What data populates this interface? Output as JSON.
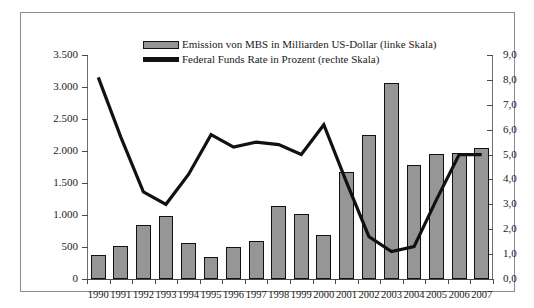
{
  "chart_data": {
    "type": "bar",
    "title": "",
    "subtitle": "",
    "xlabel": "",
    "ylabel": "",
    "grid": false,
    "legend_position": "top-center",
    "categories": [
      "1990",
      "1991",
      "1992",
      "1993",
      "1994",
      "1995",
      "1996",
      "1997",
      "1998",
      "1999",
      "2000",
      "2001",
      "2002",
      "2003",
      "2004",
      "2005",
      "2006",
      "2007"
    ],
    "left_axis": {
      "label": "Emission von MBS in Milliarden US-Dollar",
      "ticks": [
        "0",
        "500",
        "1.000",
        "1.500",
        "2.000",
        "2.500",
        "3.000",
        "3.500"
      ],
      "tick_values": [
        0,
        500,
        1000,
        1500,
        2000,
        2500,
        3000,
        3500
      ],
      "ylim": [
        0,
        3500
      ]
    },
    "right_axis": {
      "label": "Federal Funds Rate in Prozent",
      "ticks": [
        "0,0",
        "1,0",
        "2,0",
        "3,0",
        "4,0",
        "5,0",
        "6,0",
        "7,0",
        "8,0",
        "9,0"
      ],
      "tick_values": [
        0,
        1,
        2,
        3,
        4,
        5,
        6,
        7,
        8,
        9
      ],
      "ylim": [
        0,
        9
      ]
    },
    "series": [
      {
        "name": "Emission von MBS in Milliarden US-Dollar (linke Skala)",
        "type": "bar",
        "axis": "left",
        "color": "#969696",
        "values": [
          380,
          510,
          845,
          990,
          570,
          350,
          495,
          600,
          1140,
          1020,
          680,
          1670,
          2245,
          3060,
          1775,
          1950,
          1975,
          2040
        ]
      },
      {
        "name": "Federal Funds Rate in Prozent (rechte Skala)",
        "type": "line",
        "axis": "right",
        "color": "#111111",
        "values": [
          8.1,
          5.7,
          3.5,
          3.0,
          4.2,
          5.8,
          5.3,
          5.5,
          5.4,
          5.0,
          6.2,
          3.9,
          1.7,
          1.1,
          1.3,
          3.2,
          5.0,
          5.0
        ]
      }
    ]
  },
  "legend": {
    "items": [
      {
        "label": "Emission von MBS in Milliarden US-Dollar (linke Skala)",
        "marker": "bar-swatch"
      },
      {
        "label": "Federal Funds Rate in Prozent (rechte Skala)",
        "marker": "line-swatch"
      }
    ]
  }
}
